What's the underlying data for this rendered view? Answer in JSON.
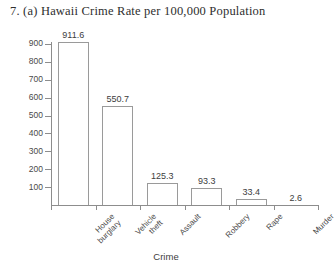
{
  "chart_data": {
    "type": "bar",
    "title": "7. (a)  Hawaii Crime Rate per 100,000 Population",
    "xlabel": "Crime",
    "ylabel": "",
    "categories": [
      "House burglary",
      "Vehicle theft",
      "Assault",
      "Robbery",
      "Rape",
      "Murder"
    ],
    "category_lines": [
      [
        "House",
        "burglary"
      ],
      [
        "Vehicle",
        "theft"
      ],
      [
        "Assault"
      ],
      [
        "Robbery"
      ],
      [
        "Rape"
      ],
      [
        "Murder"
      ]
    ],
    "values": [
      911.6,
      550.7,
      125.3,
      93.3,
      33.4,
      2.6
    ],
    "value_labels": [
      "911.6",
      "550.7",
      "125.3",
      "93.3",
      "33.4",
      "2.6"
    ],
    "ylim": [
      0,
      950
    ],
    "yticks": [
      100,
      200,
      300,
      400,
      500,
      600,
      700,
      800,
      900
    ],
    "ytick_labels": [
      "100",
      "200",
      "300",
      "400",
      "500",
      "600",
      "700",
      "800",
      "900"
    ],
    "grid": false,
    "legend": false,
    "bar_color": "#ffffff",
    "bar_edge_color": "#9a9a9a",
    "axis_color": "#8d8d8d"
  }
}
